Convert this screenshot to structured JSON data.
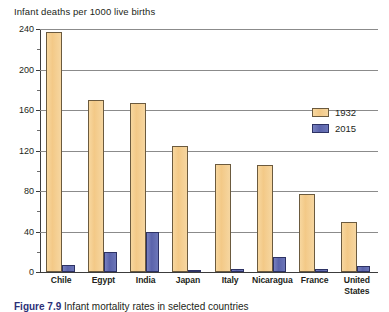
{
  "chart_data": {
    "type": "bar",
    "title": "Infant deaths per 1000 live births",
    "xlabel": "",
    "ylabel": "",
    "ylim": [
      0,
      240
    ],
    "yticks": [
      0,
      40,
      80,
      120,
      160,
      200,
      240
    ],
    "ytick_labels": [
      "0",
      "40",
      "80",
      "120",
      "160",
      "200",
      "240"
    ],
    "minor_tick_interval": 20,
    "grid": true,
    "legend_position": "upper-right-inside",
    "categories": [
      "Chile",
      "Egypt",
      "India",
      "Japan",
      "Italy",
      "Nicaragua",
      "France",
      "United States"
    ],
    "category_lines": [
      [
        "Chile"
      ],
      [
        "Egypt"
      ],
      [
        "India"
      ],
      [
        "Japan"
      ],
      [
        "Italy"
      ],
      [
        "Nicaragua"
      ],
      [
        "France"
      ],
      [
        "United",
        "States"
      ]
    ],
    "series": [
      {
        "name": "1932",
        "color": "#F3C987",
        "values": [
          237,
          170,
          167,
          124,
          107,
          106,
          77,
          49
        ]
      },
      {
        "name": "2015",
        "color": "#5A63AB",
        "values": [
          7,
          20,
          40,
          2,
          3,
          15,
          3,
          6
        ]
      }
    ]
  },
  "caption": {
    "figure_number": "Figure 7.9",
    "text": "Infant mortality rates in selected countries"
  }
}
